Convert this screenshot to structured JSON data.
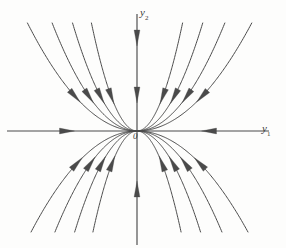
{
  "figure": {
    "type": "phase-portrait",
    "title": "",
    "background_color": "#fdfdfc",
    "ink_color": "#4a4a4a"
  },
  "axes": {
    "horizontal": {
      "label": "y",
      "subscript": "1",
      "label_full": "y1",
      "x_start": -130,
      "x_end": 132,
      "arrows": [
        {
          "at_x": -70,
          "direction": "right"
        },
        {
          "at_x": 72,
          "direction": "left"
        }
      ]
    },
    "vertical": {
      "label": "y",
      "subscript": "2",
      "label_full": "y2",
      "y_start": -114,
      "y_end": 117,
      "arrows": [
        {
          "at_y": 93,
          "direction": "down"
        },
        {
          "at_y": 36,
          "direction": "down"
        },
        {
          "at_y": -58,
          "direction": "up"
        }
      ]
    },
    "origin_label": "0",
    "origin_px": {
      "x": 137,
      "y": 131
    }
  },
  "chart_data": {
    "type": "line",
    "title": "",
    "xlabel": "y1",
    "ylabel": "y2",
    "equilibrium": {
      "x": 0,
      "y": 0,
      "kind": "stable node",
      "label": "0"
    },
    "flow_direction": "inward",
    "tangent_axis": "y1",
    "grid": false,
    "legend": false,
    "xlim": [
      -140,
      150
    ],
    "ylim": [
      -120,
      125
    ],
    "trajectories": [
      {
        "id": "ul-1",
        "quadrant": "upper-left",
        "k": 0.009,
        "x_tip": -69,
        "arrow_t": 0.56
      },
      {
        "id": "ul-2",
        "quadrant": "upper-left",
        "k": 0.015,
        "x_tip": -54,
        "arrow_t": 0.56
      },
      {
        "id": "ul-3",
        "quadrant": "upper-left",
        "k": 0.026,
        "x_tip": -41,
        "arrow_t": 0.56
      },
      {
        "id": "ul-4",
        "quadrant": "upper-left",
        "k": 0.052,
        "x_tip": -29,
        "arrow_t": 0.56
      },
      {
        "id": "ur-1",
        "quadrant": "upper-right",
        "k": 0.052,
        "x_tip": 28,
        "arrow_t": 0.56
      },
      {
        "id": "ur-2",
        "quadrant": "upper-right",
        "k": 0.025,
        "x_tip": 41,
        "arrow_t": 0.56
      },
      {
        "id": "ur-3",
        "quadrant": "upper-right",
        "k": 0.014,
        "x_tip": 56,
        "arrow_t": 0.56
      },
      {
        "id": "ur-4",
        "quadrant": "upper-right",
        "k": 0.0082,
        "x_tip": 73,
        "arrow_t": 0.56
      },
      {
        "id": "ll-1",
        "quadrant": "lower-left",
        "k": 0.009,
        "x_tip": -69,
        "arrow_t": 0.56
      },
      {
        "id": "ll-2",
        "quadrant": "lower-left",
        "k": 0.015,
        "x_tip": -54,
        "arrow_t": 0.56
      },
      {
        "id": "ll-3",
        "quadrant": "lower-left",
        "k": 0.026,
        "x_tip": -41,
        "arrow_t": 0.56
      },
      {
        "id": "ll-4",
        "quadrant": "lower-left",
        "k": 0.052,
        "x_tip": -29,
        "arrow_t": 0.56
      },
      {
        "id": "lr-1",
        "quadrant": "lower-right",
        "k": 0.052,
        "x_tip": 28,
        "arrow_t": 0.56
      },
      {
        "id": "lr-2",
        "quadrant": "lower-right",
        "k": 0.025,
        "x_tip": 41,
        "arrow_t": 0.56
      },
      {
        "id": "lr-3",
        "quadrant": "lower-right",
        "k": 0.014,
        "x_tip": 56,
        "arrow_t": 0.56
      },
      {
        "id": "lr-4",
        "quadrant": "lower-right",
        "k": 0.0082,
        "x_tip": 73,
        "arrow_t": 0.56
      }
    ]
  }
}
